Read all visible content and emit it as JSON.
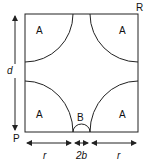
{
  "diagram": {
    "square": {
      "x": 25,
      "y": 14,
      "size": 113
    },
    "corner_labels": {
      "top_right": "R",
      "bottom_left": "P"
    },
    "region_labels": {
      "quarter_circle": "A",
      "semicircle": "B"
    },
    "dimensions": {
      "vertical": "d",
      "left_horizontal": "r",
      "middle_horizontal": "2b",
      "right_horizontal": "r"
    },
    "stroke_color": "#222222"
  }
}
